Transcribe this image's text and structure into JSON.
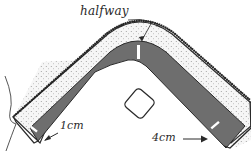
{
  "diagram": {
    "type": "sewing-illustration",
    "labels": {
      "halfway": "halfway",
      "left_measure": "1cm",
      "right_measure": "4cm"
    },
    "parts": [
      {
        "name": "outer-band",
        "description": "dotted fabric band with stitched outer edge"
      },
      {
        "name": "inner-band",
        "description": "dark grey inner fabric band"
      },
      {
        "name": "halfway-mark",
        "description": "white tick mark at corner apex"
      },
      {
        "name": "left-end-mark",
        "description": "white tick mark near left end, 1cm from edge"
      },
      {
        "name": "right-end-mark",
        "description": "white tick mark near right end, 4cm from edge"
      },
      {
        "name": "center-square",
        "description": "small rounded square outline"
      },
      {
        "name": "thread",
        "description": "loose thread curve on left"
      }
    ],
    "colors": {
      "outline": "#2a2a2a",
      "inner_band": "#6e6e6e",
      "dotted_band": "#f4f4f4",
      "marks": "#ffffff"
    }
  }
}
